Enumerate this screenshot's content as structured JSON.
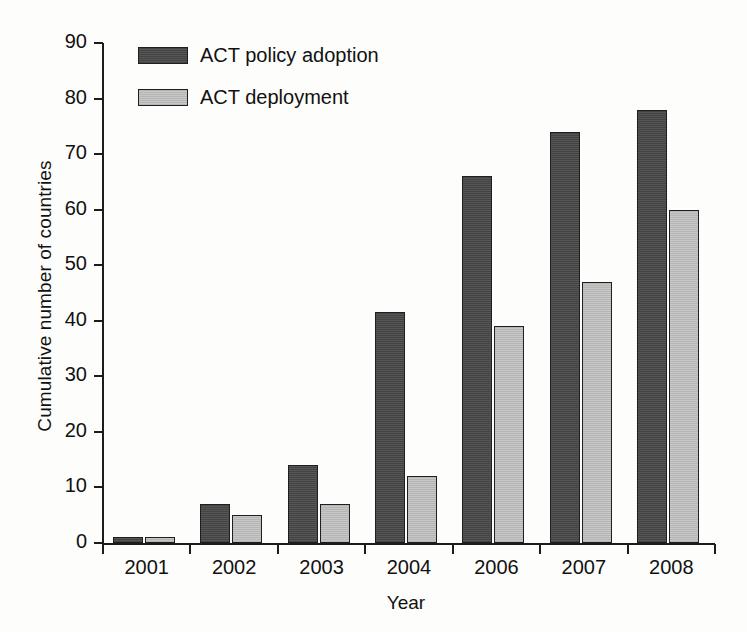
{
  "chart_data": {
    "type": "bar",
    "title": "",
    "subtitle": "",
    "xlabel": "Year",
    "ylabel": "Cumulative number of countries",
    "categories": [
      "2001",
      "2002",
      "2003",
      "2004",
      "2006",
      "2007",
      "2008"
    ],
    "series": [
      {
        "name": "ACT policy adoption",
        "color": "#4d4d4d",
        "values": [
          1,
          7,
          14,
          41.5,
          66,
          74,
          78
        ]
      },
      {
        "name": "ACT deployment",
        "color": "#c3c3c3",
        "values": [
          1,
          5,
          7,
          12,
          39,
          47,
          60
        ]
      }
    ],
    "ylim": [
      0,
      90
    ],
    "yticks": [
      0,
      10,
      20,
      30,
      40,
      50,
      60,
      70,
      80,
      90
    ],
    "ytick_labels": [
      "0",
      "10",
      "20",
      "30",
      "40",
      "50",
      "60",
      "70",
      "80",
      "90"
    ],
    "grid": false,
    "legend_position": "top-left",
    "legend_entries": [
      "ACT policy adoption",
      "ACT deployment"
    ]
  },
  "legend": {
    "items": [
      {
        "label": "ACT policy adoption",
        "style": "dark"
      },
      {
        "label": "ACT deployment",
        "style": "light"
      }
    ]
  },
  "axes": {
    "y_title": "Cumulative number of countries",
    "x_title": "Year"
  }
}
